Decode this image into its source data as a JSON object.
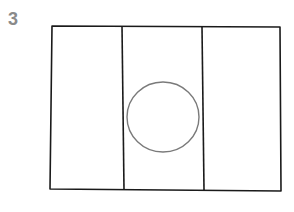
{
  "figure": {
    "label": "3",
    "colors": {
      "ink": "#1a1a1a",
      "circle": "#7a7a7a",
      "label": "#8a8a8a"
    },
    "panels": 3
  }
}
